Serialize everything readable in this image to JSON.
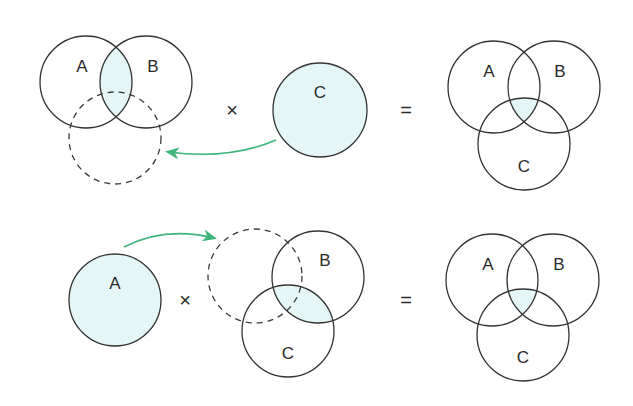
{
  "colors": {
    "fill": "#e4f6f6",
    "stroke": "#333333",
    "arrow": "#3db57a",
    "background": "#ffffff"
  },
  "symbols": {
    "times": "×",
    "equals": "="
  },
  "rows": [
    {
      "name": "top-row",
      "left_group": {
        "circles": [
          {
            "label": "A",
            "cx": 86,
            "cy": 82,
            "r": 46,
            "style": "solid",
            "label_x": 82,
            "label_y": 72
          },
          {
            "label": "B",
            "cx": 146,
            "cy": 82,
            "r": 46,
            "style": "solid",
            "label_x": 153,
            "label_y": 72
          },
          {
            "label": "",
            "cx": 115,
            "cy": 138,
            "r": 46,
            "style": "dashed"
          }
        ],
        "highlight": "A∩B"
      },
      "operand": {
        "label": "C",
        "cx": 320,
        "cy": 110,
        "r": 47,
        "filled": true,
        "label_x": 320,
        "label_y": 98
      },
      "times_pos": [
        232,
        110
      ],
      "equals_pos": [
        406,
        110
      ],
      "arrow": {
        "from": [
          276,
          140
        ],
        "to": [
          166,
          153
        ],
        "direction": "left"
      },
      "result": {
        "circles": [
          {
            "label": "A",
            "cx": 494,
            "cy": 87,
            "r": 46,
            "label_x": 489,
            "label_y": 77
          },
          {
            "label": "B",
            "cx": 554,
            "cy": 87,
            "r": 46,
            "label_x": 560,
            "label_y": 77
          },
          {
            "label": "C",
            "cx": 524,
            "cy": 144,
            "r": 46,
            "label_x": 524,
            "label_y": 172
          }
        ],
        "highlight": "A∩B∩C"
      }
    },
    {
      "name": "bottom-row",
      "operand": {
        "label": "A",
        "cx": 115,
        "cy": 300,
        "r": 46,
        "filled": true,
        "label_x": 115,
        "label_y": 289
      },
      "times_pos": [
        185,
        300
      ],
      "equals_pos": [
        406,
        300
      ],
      "arrow": {
        "from": [
          124,
          247
        ],
        "to": [
          216,
          238
        ],
        "direction": "right"
      },
      "right_group": {
        "circles": [
          {
            "label": "",
            "cx": 255,
            "cy": 276,
            "r": 47,
            "style": "dashed"
          },
          {
            "label": "B",
            "cx": 318,
            "cy": 277,
            "r": 46,
            "style": "solid",
            "label_x": 325,
            "label_y": 266
          },
          {
            "label": "C",
            "cx": 288,
            "cy": 331,
            "r": 46,
            "style": "solid",
            "label_x": 288,
            "label_y": 359
          }
        ],
        "highlight": "B∩C"
      },
      "result": {
        "circles": [
          {
            "label": "A",
            "cx": 492,
            "cy": 280,
            "r": 46,
            "label_x": 488,
            "label_y": 270
          },
          {
            "label": "B",
            "cx": 553,
            "cy": 280,
            "r": 46,
            "label_x": 559,
            "label_y": 270
          },
          {
            "label": "C",
            "cx": 523,
            "cy": 335,
            "r": 46,
            "label_x": 523,
            "label_y": 363
          }
        ],
        "highlight": "A∩B∩C"
      }
    }
  ]
}
